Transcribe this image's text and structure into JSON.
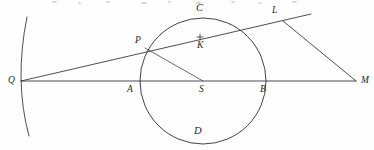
{
  "figure": {
    "type": "geometry-diagram",
    "canvas": {
      "width": 374,
      "height": 150,
      "background": "#fefefe"
    },
    "stroke_color": "#2e2e33",
    "label_color": "#1f1f24",
    "points": [
      {
        "id": "Q",
        "label": "Q",
        "x": 21,
        "y": 81,
        "label_x": 8,
        "label_y": 76,
        "role": "external-left-point"
      },
      {
        "id": "A",
        "label": "A",
        "x": 141,
        "y": 81,
        "label_x": 127,
        "label_y": 85,
        "role": "circle-left-intersection"
      },
      {
        "id": "S",
        "label": "S",
        "x": 203,
        "y": 81,
        "label_x": 199,
        "label_y": 85,
        "role": "circle-center"
      },
      {
        "id": "B",
        "label": "B",
        "x": 265,
        "y": 81,
        "label_x": 260,
        "label_y": 85,
        "role": "circle-right-intersection"
      },
      {
        "id": "M",
        "label": "M",
        "x": 355,
        "y": 81,
        "label_x": 361,
        "label_y": 76,
        "role": "external-right-point"
      },
      {
        "id": "P",
        "label": "P",
        "x": 145,
        "y": 48,
        "label_x": 135,
        "label_y": 36,
        "role": "secant-circle-touch"
      },
      {
        "id": "C",
        "label": "C",
        "x": 200,
        "y": 17,
        "label_x": 196,
        "label_y": 3,
        "role": "circle-top-label"
      },
      {
        "id": "D",
        "label": "D",
        "x": 200,
        "y": 145,
        "label_x": 194,
        "label_y": 126,
        "role": "circle-bottom-label"
      },
      {
        "id": "K",
        "label": "K",
        "x": 200,
        "y": 37,
        "label_x": 197,
        "label_y": 41,
        "role": "chord-midpoint"
      },
      {
        "id": "L",
        "label": "L",
        "x": 283,
        "y": 21,
        "label_x": 272,
        "label_y": 6,
        "role": "tangent-vertex"
      }
    ],
    "circle": {
      "cx": 203,
      "cy": 81,
      "r": 63,
      "label_top": "C",
      "label_bottom": "D"
    },
    "arc_left": {
      "start_x": 27,
      "start_y": 17,
      "end_x": 29,
      "end_y": 136,
      "bulge_x": 17,
      "bulge_y": 81
    },
    "segments": [
      {
        "id": "QM",
        "from": "Q",
        "to": "M",
        "kind": "baseline-through-circle"
      },
      {
        "id": "QPL",
        "from": "Q",
        "to": "beyond-L",
        "kind": "secant-ray"
      },
      {
        "id": "PS",
        "from": "P",
        "to": "S",
        "kind": "radius"
      },
      {
        "id": "LM",
        "from": "L",
        "to": "M",
        "kind": "tangent-chord"
      }
    ],
    "tick": {
      "x": 200,
      "y": 37,
      "size": 3,
      "description": "small cross mark on secant at K"
    }
  }
}
